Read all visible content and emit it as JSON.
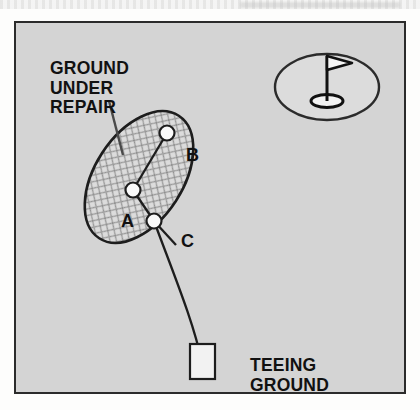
{
  "figure": {
    "kind": "golf-rules-diagram",
    "background_color": "#d4d4d4",
    "border_color": "#2b2b2b",
    "ink_color": "#111111",
    "labels": {
      "ground_under_repair": "GROUND\nUNDER\nREPAIR",
      "teeing_ground": "TEEING\nGROUND"
    },
    "points": [
      {
        "id": "A",
        "label": "A",
        "x": 131,
        "y": 188,
        "marker": "white-ball"
      },
      {
        "id": "B",
        "label": "B",
        "x": 165,
        "y": 131,
        "marker": "white-ball"
      },
      {
        "id": "C",
        "label": "C",
        "x": 152,
        "y": 219,
        "marker": "white-ball"
      }
    ],
    "areas": {
      "ground_under_repair": {
        "shape": "ellipse",
        "fill": "crosshatch",
        "center_x": 137,
        "center_y": 175,
        "radius_x": 44,
        "radius_y": 73,
        "rotation_deg": 33
      },
      "putting_green": {
        "shape": "ellipse",
        "center_x": 325,
        "center_y": 85,
        "radius_x": 52,
        "radius_y": 33
      },
      "teeing_ground": {
        "shape": "rectangle",
        "x": 188,
        "y": 342,
        "width": 25,
        "height": 35,
        "fill": "#f2f2f2"
      }
    },
    "icons": {
      "flagstick": "flag-icon",
      "hole": "hole-icon",
      "leader": "leader-line-icon"
    }
  }
}
